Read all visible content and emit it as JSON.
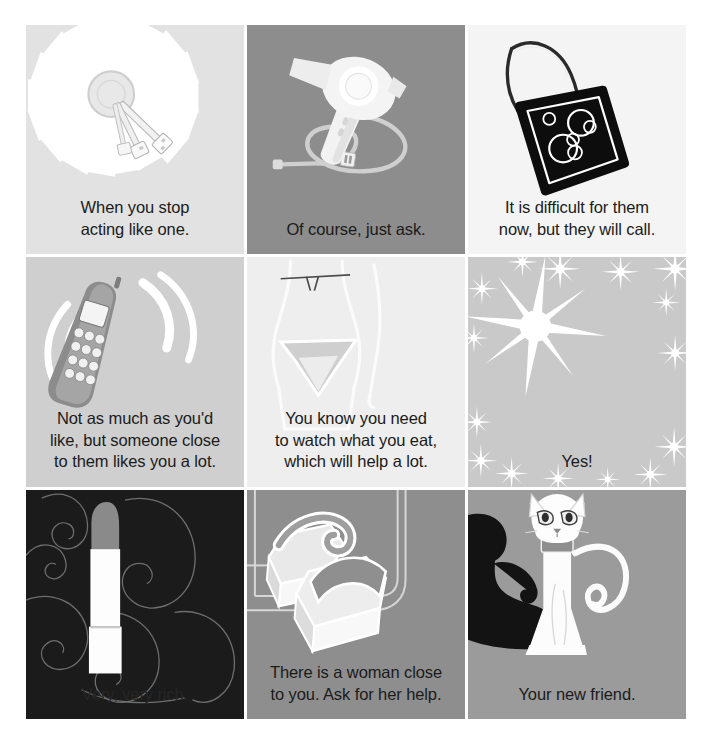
{
  "page": {
    "background_color": "#ffffff",
    "grid": {
      "rows": 3,
      "columns": 3,
      "gap_px": 3
    }
  },
  "cells": [
    {
      "id": "cell-keys",
      "position": "row1-col1",
      "icon": "keys-sunburst-icon",
      "icon_label": "Keys on ring with radial sunburst",
      "background_color": "#e2e2e2",
      "text_color": "#1b1b1b",
      "caption": "When you stop\nacting like one."
    },
    {
      "id": "cell-hairdryer",
      "position": "row1-col2",
      "icon": "hair-dryer-icon",
      "icon_label": "Hair dryer with coiled power cord",
      "background_color": "#8d8d8d",
      "text_color": "#1b1b1b",
      "caption": "Of course, just ask."
    },
    {
      "id": "cell-handbag",
      "position": "row1-col3",
      "icon": "handbag-icon",
      "icon_label": "Black handbag with circle pattern",
      "background_color": "#f4f4f4",
      "text_color": "#1b1b1b",
      "caption": "It is difficult for them\nnow, but they will call."
    },
    {
      "id": "cell-mobile-phone",
      "position": "row2-col1",
      "icon": "mobile-phone-ringing-icon",
      "icon_label": "Mobile phone with ringing waves",
      "background_color": "#cfcfcf",
      "text_color": "#1b1b1b",
      "caption": "Not as much as you'd\nlike, but someone close\nto them likes you a lot."
    },
    {
      "id": "cell-bikini",
      "position": "row2-col2",
      "icon": "bikini-figure-icon",
      "icon_label": "Outline of female figure in bikini",
      "background_color": "#eeeeee",
      "text_color": "#1b1b1b",
      "caption": "You know you need\nto watch what you eat,\nwhich will help a lot."
    },
    {
      "id": "cell-sparkle",
      "position": "row2-col3",
      "icon": "sparkle-star-icon",
      "icon_label": "Large sparkle star with small sparkles",
      "background_color": "#c9c9c9",
      "text_color": "#1b1b1b",
      "caption": "Yes!"
    },
    {
      "id": "cell-lipstick",
      "position": "row3-col1",
      "icon": "lipstick-icon",
      "icon_label": "Lipstick tube on dark swirl background",
      "background_color": "#1b1b1b",
      "text_color": "#262626",
      "caption": "Very, very rich."
    },
    {
      "id": "cell-shoes",
      "position": "row3-col2",
      "icon": "platform-sandals-icon",
      "icon_label": "Pair of platform sandals",
      "background_color": "#8e8e8e",
      "text_color": "#1b1b1b",
      "caption": "There is a woman close\nto you. Ask for her help."
    },
    {
      "id": "cell-cat",
      "position": "row3-col3",
      "icon": "cat-icon",
      "icon_label": "White cat with collar and shadow",
      "background_color": "#9b9b9b",
      "text_color": "#1b1b1b",
      "caption": "Your new friend."
    }
  ]
}
